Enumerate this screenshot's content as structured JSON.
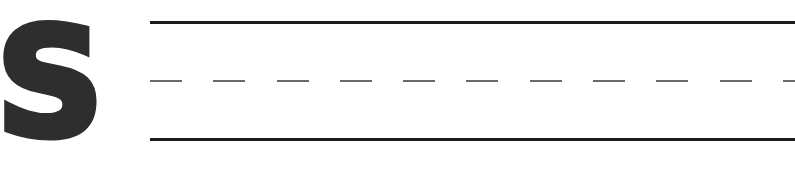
{
  "worksheet": {
    "letter": "S",
    "letter_color": "#2e2e2e",
    "guide_lines": {
      "top": {
        "style": "solid",
        "color": "#1c1c1c"
      },
      "middle": {
        "style": "dashed",
        "color": "#6a6a6a"
      },
      "bottom": {
        "style": "solid",
        "color": "#1c1c1c"
      }
    }
  }
}
